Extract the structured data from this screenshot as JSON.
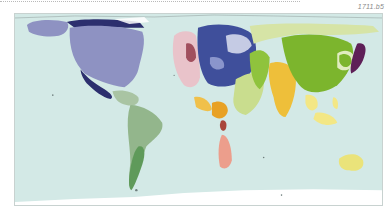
{
  "figure": {
    "id_label": "1711.b5",
    "type": "world cartogram"
  },
  "map": {
    "ocean_color": "#d3e9e6",
    "antarctica_color": "#ffffff",
    "regions": [
      {
        "name": "North America",
        "color": "#8e92c2"
      },
      {
        "name": "Alaska / Canada North",
        "color": "#8e92c2"
      },
      {
        "name": "Mexico / Central Coast",
        "color": "#2c2f6e"
      },
      {
        "name": "Caribbean / Central America",
        "color": "#a9c4a3"
      },
      {
        "name": "South America",
        "color": "#93b68c"
      },
      {
        "name": "Southern Cone",
        "color": "#5f9a5a"
      },
      {
        "name": "Western Europe",
        "color": "#e9c3ca"
      },
      {
        "name": "Western Europe Dark",
        "color": "#a14f5e"
      },
      {
        "name": "Northern / Eastern Europe",
        "color": "#3f4f9b"
      },
      {
        "name": "Eastern Europe Light",
        "color": "#c5cbe4"
      },
      {
        "name": "North Africa",
        "color": "#f0c04a"
      },
      {
        "name": "West Africa",
        "color": "#e8a124"
      },
      {
        "name": "Southern Africa",
        "color": "#ec9e8c"
      },
      {
        "name": "Middle East / Central Asia",
        "color": "#c9dd8e"
      },
      {
        "name": "Russia / North Asia",
        "color": "#d6e4a6"
      },
      {
        "name": "Central Asia Green",
        "color": "#8fc33d"
      },
      {
        "name": "South Asia",
        "color": "#eebf3a"
      },
      {
        "name": "East Asia",
        "color": "#7cb52d"
      },
      {
        "name": "Korea / Japan",
        "color": "#5e1f57"
      },
      {
        "name": "Southeast Asia",
        "color": "#f3e785"
      },
      {
        "name": "Oceania",
        "color": "#eae37a"
      }
    ]
  }
}
